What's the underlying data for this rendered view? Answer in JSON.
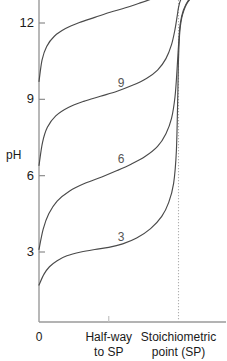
{
  "chart_data": {
    "type": "line",
    "title": "",
    "subtitle": "",
    "xlabel": "",
    "ylabel": "pH",
    "ylim": [
      0,
      14
    ],
    "xlim": [
      0,
      1.15
    ],
    "grid": false,
    "legend_position": "inline-curve-labels",
    "y_ticks": [
      {
        "value": 12,
        "label": "12"
      },
      {
        "value": 9,
        "label": "9"
      },
      {
        "value": 6,
        "label": "6"
      },
      {
        "value": 3,
        "label": "3"
      }
    ],
    "x_ticks": [
      {
        "value": 0.0,
        "label": "0"
      },
      {
        "value": 0.5,
        "label": "Half-way\nto SP"
      },
      {
        "value": 1.0,
        "label": "Stoichiometric\npoint (SP)"
      }
    ],
    "annotations": [
      {
        "name": "stoichiometric-point-line",
        "x": 1.0,
        "style": "dotted-vertical",
        "color": "#b0b0b0"
      }
    ],
    "series": [
      {
        "name": "3",
        "label": "3",
        "pKa": 3,
        "label_x": 0.565,
        "label_y": 3.55,
        "color": "#4a4a4a",
        "points": [
          [
            0.0,
            1.7
          ],
          [
            0.035,
            2.12
          ],
          [
            0.075,
            2.42
          ],
          [
            0.13,
            2.66
          ],
          [
            0.2,
            2.85
          ],
          [
            0.3,
            3.0
          ],
          [
            0.4,
            3.1
          ],
          [
            0.5,
            3.18
          ],
          [
            0.6,
            3.32
          ],
          [
            0.7,
            3.55
          ],
          [
            0.8,
            3.92
          ],
          [
            0.88,
            4.4
          ],
          [
            0.93,
            4.95
          ],
          [
            0.965,
            5.7
          ],
          [
            0.985,
            7.0
          ],
          [
            0.995,
            9.2
          ],
          [
            1.0,
            10.6
          ],
          [
            1.01,
            11.7
          ],
          [
            1.03,
            12.35
          ],
          [
            1.07,
            12.85
          ],
          [
            1.15,
            13.25
          ]
        ]
      },
      {
        "name": "6",
        "label": "6",
        "pKa": 6,
        "label_x": 0.565,
        "label_y": 6.6,
        "color": "#4a4a4a",
        "points": [
          [
            0.0,
            3.1
          ],
          [
            0.03,
            3.9
          ],
          [
            0.07,
            4.5
          ],
          [
            0.13,
            5.0
          ],
          [
            0.22,
            5.4
          ],
          [
            0.33,
            5.7
          ],
          [
            0.45,
            5.95
          ],
          [
            0.56,
            6.2
          ],
          [
            0.66,
            6.45
          ],
          [
            0.76,
            6.75
          ],
          [
            0.85,
            7.15
          ],
          [
            0.91,
            7.65
          ],
          [
            0.95,
            8.25
          ],
          [
            0.975,
            9.1
          ],
          [
            0.99,
            10.2
          ],
          [
            1.0,
            11.1
          ],
          [
            1.012,
            11.95
          ],
          [
            1.035,
            12.5
          ],
          [
            1.075,
            12.92
          ],
          [
            1.15,
            13.28
          ]
        ]
      },
      {
        "name": "9",
        "label": "9",
        "pKa": 9,
        "label_x": 0.565,
        "label_y": 9.6,
        "color": "#4a4a4a",
        "points": [
          [
            0.0,
            6.4
          ],
          [
            0.025,
            7.3
          ],
          [
            0.06,
            7.9
          ],
          [
            0.12,
            8.35
          ],
          [
            0.21,
            8.68
          ],
          [
            0.32,
            8.92
          ],
          [
            0.44,
            9.12
          ],
          [
            0.56,
            9.32
          ],
          [
            0.67,
            9.55
          ],
          [
            0.77,
            9.82
          ],
          [
            0.85,
            10.15
          ],
          [
            0.91,
            10.6
          ],
          [
            0.95,
            11.15
          ],
          [
            0.975,
            11.75
          ],
          [
            0.99,
            12.25
          ],
          [
            1.0,
            12.6
          ],
          [
            1.015,
            12.9
          ],
          [
            1.045,
            13.12
          ],
          [
            1.09,
            13.28
          ],
          [
            1.15,
            13.38
          ]
        ]
      },
      {
        "name": "12",
        "label": "12",
        "pKa": 12,
        "label_x": 0.54,
        "label_y": 13.7,
        "color": "#4a4a4a",
        "points": [
          [
            0.0,
            9.7
          ],
          [
            0.022,
            10.55
          ],
          [
            0.055,
            11.08
          ],
          [
            0.11,
            11.48
          ],
          [
            0.19,
            11.78
          ],
          [
            0.29,
            12.02
          ],
          [
            0.4,
            12.22
          ],
          [
            0.51,
            12.42
          ],
          [
            0.62,
            12.6
          ],
          [
            0.72,
            12.78
          ],
          [
            0.81,
            12.95
          ],
          [
            0.88,
            13.1
          ],
          [
            0.935,
            13.25
          ],
          [
            0.975,
            13.38
          ],
          [
            1.0,
            13.46
          ],
          [
            1.04,
            13.56
          ],
          [
            1.09,
            13.64
          ],
          [
            1.15,
            13.7
          ]
        ]
      }
    ]
  },
  "axes": {
    "y_axis_name": "pH"
  }
}
